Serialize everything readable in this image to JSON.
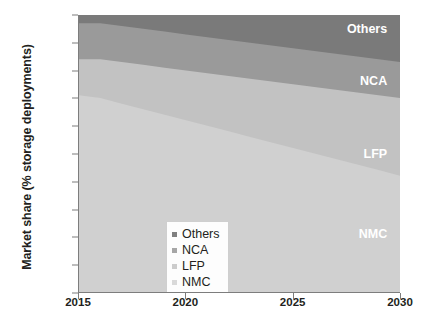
{
  "chart_data": {
    "type": "area",
    "stacked": true,
    "title": "",
    "xlabel": "",
    "ylabel": "Market share (% storage deployments)",
    "x": [
      2015,
      2016,
      2017,
      2018,
      2019,
      2020,
      2021,
      2022,
      2023,
      2024,
      2025,
      2026,
      2027,
      2028,
      2029,
      2030
    ],
    "xlim": [
      2015,
      2030
    ],
    "ylim": [
      0,
      100
    ],
    "x_tick_labels": [
      "2015",
      "2020",
      "2025",
      "2030"
    ],
    "x_tick_values": [
      2015,
      2020,
      2025,
      2030
    ],
    "y_tick_labels": [
      "0%",
      "10%",
      "20%",
      "30%",
      "40%",
      "50%",
      "60%",
      "70%",
      "80%",
      "90%",
      "100%"
    ],
    "y_tick_values": [
      0,
      10,
      20,
      30,
      40,
      50,
      60,
      70,
      80,
      90,
      100
    ],
    "grid": false,
    "legend_position": "lower-left-inside",
    "series": [
      {
        "name": "NMC",
        "color": "#d0d0d0",
        "legend_swatch": "#d9d9d9",
        "label_color": "#ffffff",
        "values": [
          71,
          70,
          68,
          66,
          64,
          62,
          60,
          58,
          56,
          54,
          52,
          50,
          48,
          46,
          44,
          42
        ]
      },
      {
        "name": "LFP",
        "color": "#c2c2c2",
        "legend_swatch": "#cccccc",
        "label_color": "#ffffff",
        "values": [
          13,
          14,
          15,
          16,
          17,
          18,
          19,
          20,
          21,
          22,
          23,
          24,
          25,
          26,
          27,
          28
        ]
      },
      {
        "name": "NCA",
        "color": "#9a9a9a",
        "legend_swatch": "#a6a6a6",
        "label_color": "#ffffff",
        "values": [
          13,
          13,
          13,
          13,
          13,
          13,
          13,
          13,
          13,
          13,
          13,
          13,
          13,
          13,
          13,
          13
        ]
      },
      {
        "name": "Others",
        "color": "#7a7a7a",
        "legend_swatch": "#808080",
        "label_color": "#ffffff",
        "values": [
          3,
          3,
          4,
          5,
          6,
          7,
          8,
          9,
          10,
          11,
          12,
          13,
          14,
          15,
          16,
          17
        ]
      }
    ],
    "cumulative_upper_bounds": {
      "NMC": [
        71,
        70,
        68,
        66,
        64,
        62,
        60,
        58,
        56,
        54,
        52,
        50,
        48,
        46,
        44,
        42
      ],
      "LFP": [
        84,
        84,
        83,
        82,
        81,
        80,
        79,
        78,
        77,
        76,
        75,
        74,
        73,
        72,
        71,
        70
      ],
      "NCA": [
        97,
        97,
        96,
        95,
        94,
        93,
        92,
        91,
        90,
        89,
        88,
        87,
        86,
        85,
        84,
        83
      ],
      "Others": [
        100,
        100,
        100,
        100,
        100,
        100,
        100,
        100,
        100,
        100,
        100,
        100,
        100,
        100,
        100,
        100
      ]
    },
    "inplot_labels": [
      {
        "name": "Others",
        "text": "Others",
        "x_pct": 96,
        "y_pct": 95
      },
      {
        "name": "NCA",
        "text": "NCA",
        "x_pct": 96,
        "y_pct": 76
      },
      {
        "name": "LFP",
        "text": "LFP",
        "x_pct": 96,
        "y_pct": 50
      },
      {
        "name": "NMC",
        "text": "NMC",
        "x_pct": 96,
        "y_pct": 21
      }
    ],
    "legend_entries": [
      "Others",
      "NCA",
      "LFP",
      "NMC"
    ],
    "plot_background": "#f4f4f4",
    "axis_color": "#7d7d7d",
    "text_color": "#231f20"
  },
  "caption": {
    "text": ""
  }
}
